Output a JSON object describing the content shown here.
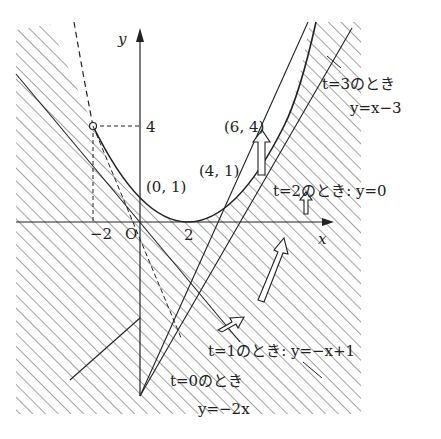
{
  "figure": {
    "type": "diagram",
    "axes": {
      "x_label": "x",
      "y_label": "y",
      "origin_label": "O",
      "tick_labels": {
        "x_neg2": "−2",
        "x_2": "2",
        "y_4": "4"
      }
    },
    "points": {
      "p1": "(0, 1)",
      "p2": "(4, 1)",
      "p3": "(6, 4)"
    },
    "annotations": {
      "t3_line1": "t=3のとき",
      "t3_line2": "y=x−3",
      "t2": "t=2のとき: y=0",
      "t1": "t=1のとき: y=−x+1",
      "t0_line1": "t=0のとき",
      "t0_line2": "y=−2x"
    },
    "colors": {
      "ink": "#222222",
      "background": "#ffffff",
      "hatch": "#444444"
    }
  }
}
